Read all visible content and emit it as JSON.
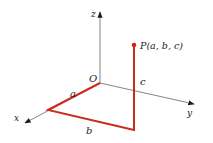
{
  "diagram": {
    "colors": {
      "axis": "#777777",
      "arrow": "#1a1a1a",
      "path": "#cc2a1a",
      "text": "#222222",
      "background": "#ffffff"
    },
    "origin": {
      "label": "O",
      "x": 100,
      "y": 83
    },
    "axes": [
      {
        "name": "z",
        "label": "z",
        "end": [
          100,
          12
        ],
        "label_pos": [
          93,
          16
        ]
      },
      {
        "name": "y",
        "label": "y",
        "end": [
          194,
          104
        ],
        "label_pos": [
          188,
          116
        ]
      },
      {
        "name": "x",
        "label": "x",
        "end": [
          25,
          123
        ],
        "label_pos": [
          15,
          121
        ]
      }
    ],
    "path": {
      "points": [
        [
          100,
          83
        ],
        [
          48,
          110
        ],
        [
          134,
          130
        ],
        [
          134,
          45
        ]
      ],
      "segments": [
        {
          "label": "a",
          "label_pos": [
            70,
            96
          ]
        },
        {
          "label": "b",
          "label_pos": [
            86,
            133
          ]
        },
        {
          "label": "c",
          "label_pos": [
            140,
            84
          ]
        }
      ]
    },
    "point": {
      "label": "P(a, b, c)",
      "x": 134,
      "y": 45,
      "label_pos": [
        140,
        49
      ]
    }
  }
}
